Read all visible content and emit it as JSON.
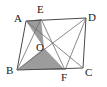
{
  "figure": {
    "type": "geometry-diagram",
    "background_color": "#ffffff",
    "line_color": "#4a4a4a",
    "shade_color": "#9c9c9c",
    "label_color": "#1a1a1a",
    "vertices": [
      {
        "name": "A",
        "label": "A",
        "x": 26,
        "y": 21,
        "label_x": 14,
        "label_y": 22
      },
      {
        "name": "E",
        "label": "E",
        "x": 41,
        "y": 19,
        "label_x": 37,
        "label_y": 13
      },
      {
        "name": "D",
        "label": "D",
        "x": 86,
        "y": 18,
        "label_x": 88,
        "label_y": 21
      },
      {
        "name": "O",
        "label": "O",
        "x": 44,
        "y": 48,
        "label_x": 37,
        "label_y": 50
      },
      {
        "name": "B",
        "label": "B",
        "x": 17,
        "y": 70,
        "label_x": 6,
        "label_y": 74
      },
      {
        "name": "F",
        "label": "F",
        "x": 65,
        "y": 70,
        "label_x": 61,
        "label_y": 81
      },
      {
        "name": "C",
        "label": "C",
        "x": 83,
        "y": 68,
        "label_x": 85,
        "label_y": 76
      }
    ],
    "edges": [
      {
        "name": "side-AD",
        "from": "A",
        "to": "D"
      },
      {
        "name": "side-AB",
        "from": "A",
        "to": "B"
      },
      {
        "name": "side-BC",
        "from": "B",
        "to": "C"
      },
      {
        "name": "side-DC",
        "from": "D",
        "to": "C"
      },
      {
        "name": "segment-AC",
        "from": "A",
        "to": "C"
      },
      {
        "name": "segment-BD",
        "from": "B",
        "to": "D"
      },
      {
        "name": "segment-EB",
        "from": "E",
        "to": "B"
      },
      {
        "name": "segment-EF",
        "from": "E",
        "to": "F"
      },
      {
        "name": "segment-DF",
        "from": "D",
        "to": "F"
      }
    ],
    "shaded_regions": [
      {
        "name": "triangle-AEO",
        "points": "A,E,O",
        "fill": "#9c9c9c"
      },
      {
        "name": "triangle-BOF",
        "points": "B,O,F",
        "fill": "#9c9c9c"
      }
    ]
  }
}
